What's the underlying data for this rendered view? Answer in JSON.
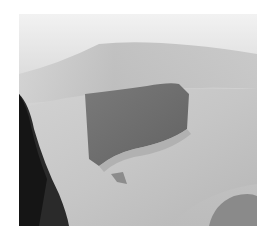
{
  "image": {
    "type": "grayscale-photo",
    "subject": "limb with dark rectangular patch",
    "colors": {
      "background": "#ffffff",
      "top_light": "#ededed",
      "mid_band": "#bdbdbd",
      "limb_skin": "#c8c8c8",
      "patch": "#6e6e6e",
      "dark_left": "#1e1e1e",
      "lower_right_shadow": "#8a8a8a"
    }
  }
}
